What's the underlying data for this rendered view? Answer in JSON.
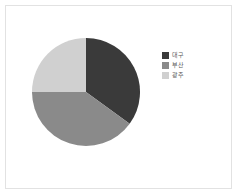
{
  "canvas": {
    "width": 238,
    "height": 195,
    "background": "#ffffff",
    "border_color": "#e2e2e2"
  },
  "legend": {
    "position": "right",
    "items": [
      {
        "label": "대구",
        "color": "#3a3a3a"
      },
      {
        "label": "부산",
        "color": "#8a8a8a"
      },
      {
        "label": "광주",
        "color": "#d0d0d0"
      }
    ]
  },
  "chart_data": {
    "type": "pie",
    "title": "",
    "subtitle": "",
    "xlabel": "",
    "ylabel": "",
    "grid": false,
    "legend_position": "right",
    "start_angle": 0,
    "direction": "clockwise",
    "categories": [
      "대구",
      "부산",
      "광주"
    ],
    "values": [
      35,
      40,
      25
    ],
    "colors": [
      "#3a3a3a",
      "#8a8a8a",
      "#d0d0d0"
    ],
    "slices": [
      {
        "label": "대구",
        "value": 35,
        "percent": 35,
        "color": "#3a3a3a",
        "start_deg": 0,
        "end_deg": 126
      },
      {
        "label": "부산",
        "value": 40,
        "percent": 40,
        "color": "#8a8a8a",
        "start_deg": 126,
        "end_deg": 270
      },
      {
        "label": "광주",
        "value": 25,
        "percent": 25,
        "color": "#d0d0d0",
        "start_deg": 270,
        "end_deg": 360
      }
    ],
    "center": {
      "x": 56,
      "y": 56
    },
    "radius": 54
  }
}
